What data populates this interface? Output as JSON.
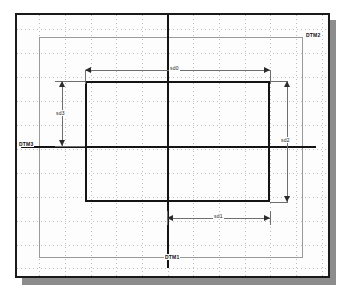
{
  "drawing": {
    "type": "cad-parametric-sketch",
    "background_color": "#ffffff",
    "frame_color": "#1a1a1a",
    "grid_color": "#bdbdbd",
    "geometry_color": "#141414",
    "reference_color": "#9a9a9a",
    "dimension_color": "#6e6e6e",
    "shadow_color": "#8c8c8c"
  },
  "datums": {
    "vertical_center": {
      "name": "DTM1",
      "label": "DTM1",
      "orientation": "vertical",
      "position_px": 166
    },
    "outer_right": {
      "name": "DTM2",
      "label": "DTM2",
      "orientation": "reference",
      "position_px": 300
    },
    "horizontal": {
      "name": "DTM3",
      "label": "DTM3",
      "orientation": "horizontal",
      "position_px": 145
    }
  },
  "dimensions": [
    {
      "id": "sd0",
      "label": "sd0",
      "orientation": "horizontal",
      "position": "top",
      "from_px": 84,
      "to_px": 268,
      "y_px": 69
    },
    {
      "id": "sd1",
      "label": "sd1",
      "orientation": "horizontal",
      "position": "bottom",
      "from_px": 166,
      "to_px": 268,
      "y_px": 216
    },
    {
      "id": "sd2",
      "label": "sd2",
      "orientation": "vertical",
      "position": "right",
      "from_px": 80,
      "to_px": 200,
      "x_px": 286
    },
    {
      "id": "sd3",
      "label": "sd3",
      "orientation": "vertical",
      "position": "left",
      "from_px": 80,
      "to_px": 145,
      "x_px": 61
    }
  ],
  "geometry": {
    "main_rectangle": {
      "name": "profile-rectangle",
      "left_px": 84,
      "top_px": 80,
      "right_px": 268,
      "bottom_px": 200
    },
    "reference_rectangle": {
      "name": "outer-reference-rectangle",
      "left_px": 38,
      "top_px": 36,
      "right_px": 300,
      "bottom_px": 256
    }
  },
  "grid": {
    "vertical_lines_px": [
      38,
      63,
      89,
      114,
      140,
      166,
      191,
      217,
      243,
      268,
      294,
      319
    ],
    "horizontal_lines_px": [
      28,
      52,
      76,
      100,
      124,
      148,
      172,
      196,
      220,
      244,
      268
    ],
    "style": "dotted"
  }
}
